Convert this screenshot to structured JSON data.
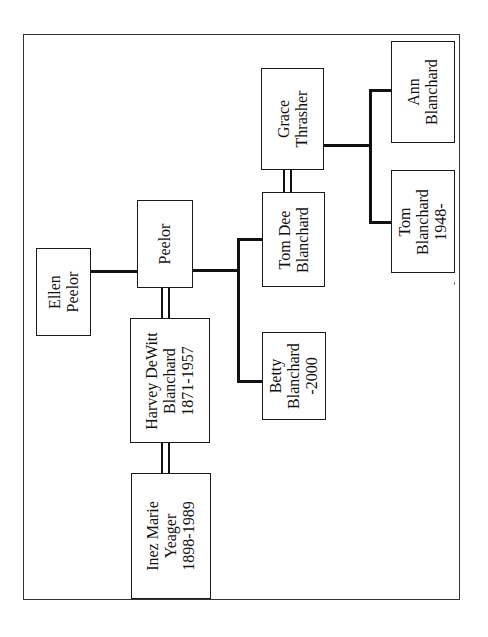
{
  "diagram": {
    "type": "family-tree",
    "orientation": "rotated-90-ccw",
    "people": [
      {
        "id": "ellen",
        "lines": [
          "Ellen",
          "Peelor"
        ]
      },
      {
        "id": "peelor",
        "lines": [
          "Peelor"
        ]
      },
      {
        "id": "harvey",
        "lines": [
          "Harvey DeWitt",
          "Blanchard",
          "1871-1957"
        ]
      },
      {
        "id": "inez",
        "lines": [
          "Inez Marie",
          "Yeager",
          "1898-1989"
        ]
      },
      {
        "id": "tomdee",
        "lines": [
          "Tom Dee",
          "Blanchard"
        ]
      },
      {
        "id": "grace",
        "lines": [
          "Grace",
          "Thrasher"
        ]
      },
      {
        "id": "betty",
        "lines": [
          "Betty",
          "Blanchard",
          "-2000"
        ]
      },
      {
        "id": "tom",
        "lines": [
          "Tom",
          "Blanchard",
          "1948-"
        ]
      },
      {
        "id": "ann",
        "lines": [
          "Ann",
          "Blanchard"
        ]
      }
    ],
    "relationships": [
      {
        "type": "marriage",
        "a": "harvey",
        "b": "peelor"
      },
      {
        "type": "marriage",
        "a": "harvey",
        "b": "inez"
      },
      {
        "type": "marriage",
        "a": "tomdee",
        "b": "grace"
      },
      {
        "type": "parent-child",
        "parent": "peelor",
        "children": [
          "tomdee",
          "betty"
        ]
      },
      {
        "type": "parent-child",
        "parent": "ellen",
        "children": [
          "peelor"
        ]
      },
      {
        "type": "parent-child",
        "parent": "grace",
        "children": [
          "tom",
          "ann"
        ]
      }
    ],
    "colors": {
      "line": "#111111",
      "border": "#1a1a1a",
      "background": "#ffffff"
    }
  }
}
